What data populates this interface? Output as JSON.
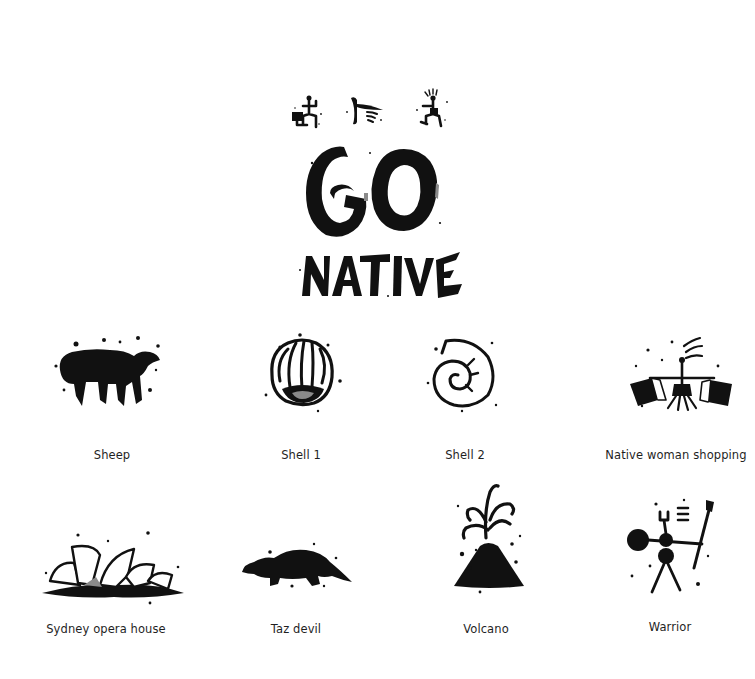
{
  "title": {
    "line1": "GO",
    "line2": "NATIVE",
    "header_glyphs": [
      "figure-with-box",
      "dolphin-and-shell",
      "figure-with-box-right"
    ]
  },
  "colors": {
    "background": "#ffffff",
    "ink": "#111111",
    "label_text": "#1f1f1f"
  },
  "glyphs": [
    {
      "id": "sheep",
      "label": "Sheep"
    },
    {
      "id": "shell-1",
      "label": "Shell 1"
    },
    {
      "id": "shell-2",
      "label": "Shell 2"
    },
    {
      "id": "native-woman-shopping",
      "label": "Native woman shopping"
    },
    {
      "id": "sydney-opera-house",
      "label": "Sydney opera house"
    },
    {
      "id": "taz-devil",
      "label": "Taz devil"
    },
    {
      "id": "volcano",
      "label": "Volcano"
    },
    {
      "id": "warrior",
      "label": "Warrior"
    }
  ]
}
